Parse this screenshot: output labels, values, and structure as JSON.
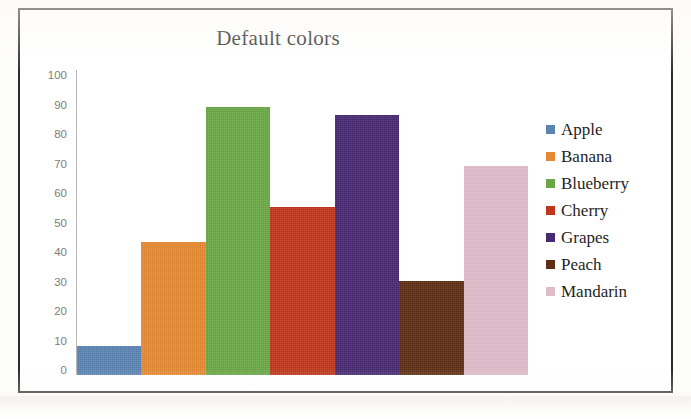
{
  "chart_data": {
    "type": "bar",
    "title": "Default colors",
    "xlabel": "",
    "ylabel": "",
    "categories": [
      "Apple",
      "Banana",
      "Blueberry",
      "Cherry",
      "Grapes",
      "Peach",
      "Mandarin"
    ],
    "values": [
      10,
      45,
      91,
      57,
      88,
      32,
      71
    ],
    "colors": [
      "#5b84b1",
      "#e58a33",
      "#69a845",
      "#c0361b",
      "#472a72",
      "#5e2f13",
      "#e0bcc9"
    ],
    "ylim": [
      0,
      100
    ],
    "yticks": [
      100,
      90,
      80,
      70,
      60,
      50,
      40,
      30,
      20,
      10,
      0
    ],
    "ytick_labels": [
      "100",
      "90",
      "80",
      "70",
      "60",
      "50",
      "40",
      "30",
      "20",
      "10",
      "0"
    ],
    "grid": false,
    "legend_position": "right",
    "legend": [
      {
        "label": "Apple",
        "color": "#5b84b1",
        "value": 10
      },
      {
        "label": "Banana",
        "color": "#e58a33",
        "value": 45
      },
      {
        "label": "Blueberry",
        "color": "#69a845",
        "value": 91
      },
      {
        "label": "Cherry",
        "color": "#c0361b",
        "value": 57
      },
      {
        "label": "Grapes",
        "color": "#472a72",
        "value": 88
      },
      {
        "label": "Peach",
        "color": "#5e2f13",
        "value": 32
      },
      {
        "label": "Mandarin",
        "color": "#e0bcc9",
        "value": 71
      }
    ]
  },
  "style": {
    "axis_label_color": "#7d7d7d",
    "title_color": "#2a2a2a",
    "frame_color": "#2b2b2b",
    "plot_background": "#ffffff"
  }
}
